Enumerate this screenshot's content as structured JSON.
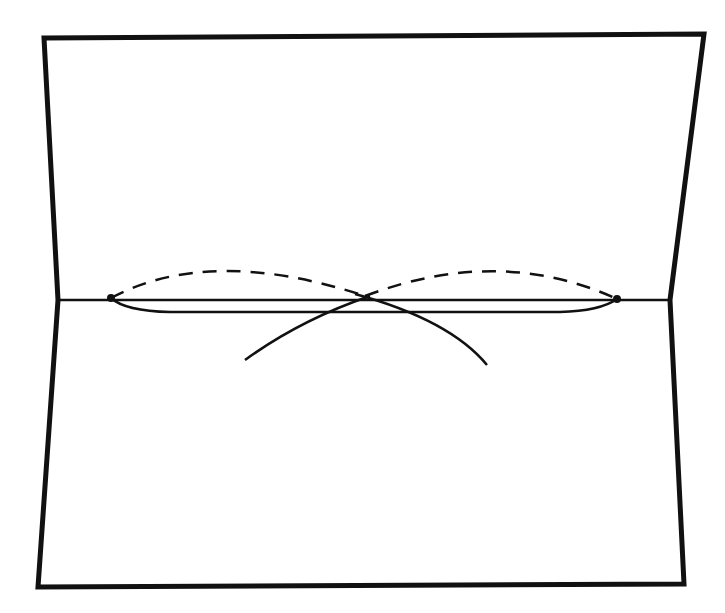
{
  "diagram": {
    "colors": {
      "stroke": "#111111",
      "background": "#ffffff"
    },
    "card_outline": {
      "points": [
        [
          44,
          38
        ],
        [
          704,
          34
        ],
        [
          670,
          300
        ],
        [
          684,
          584
        ],
        [
          38,
          587
        ],
        [
          58,
          300
        ]
      ],
      "stroke_width": 5
    },
    "fold_line": {
      "x1": 58,
      "y1": 300,
      "x2": 670,
      "y2": 300,
      "stroke_width": 2.5
    },
    "lower_line": {
      "path": "M111,298 Q125,311 170,312 L560,312 Q600,311 617,299",
      "stroke_width": 2.5
    },
    "dashed_arcs": [
      {
        "path": "M111,298 Q210,245 365,296",
        "dash": "14,10"
      },
      {
        "path": "M365,296 Q500,245 617,299",
        "dash": "14,10"
      }
    ],
    "crossing_arcs": [
      {
        "path": "M245,360 Q300,320 370,296"
      },
      {
        "path": "M487,365 Q450,320 355,294"
      }
    ],
    "points": [
      {
        "name": "left-point",
        "cx": 111,
        "cy": 298,
        "r": 4
      },
      {
        "name": "right-point",
        "cx": 617,
        "cy": 299,
        "r": 4
      }
    ]
  }
}
